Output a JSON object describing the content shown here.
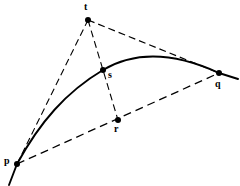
{
  "diagram": {
    "background_color": "#ffffff",
    "stroke_color": "#000000",
    "points": [
      {
        "id": "p",
        "label": "p",
        "x": 17,
        "y": 164,
        "label_x": 4,
        "label_y": 156,
        "dot_radius": 3.0
      },
      {
        "id": "q",
        "label": "q",
        "x": 219,
        "y": 73,
        "label_x": 215,
        "label_y": 79,
        "dot_radius": 3.0
      },
      {
        "id": "r",
        "label": "r",
        "x": 118,
        "y": 120,
        "label_x": 114,
        "label_y": 124,
        "dot_radius": 3.0
      },
      {
        "id": "s",
        "label": "s",
        "x": 103,
        "y": 70,
        "label_x": 108,
        "label_y": 70,
        "dot_radius": 3.0
      },
      {
        "id": "t",
        "label": "t",
        "x": 88,
        "y": 20,
        "label_x": 84,
        "label_y": 2,
        "dot_radius": 3.0
      }
    ],
    "solid_curve": {
      "name": "parabolic-arc",
      "description": "solid arc running from lower-left through s to q and beyond",
      "path": "M 9,185 L 17,164 C 40,122 66,92 103,70 C 140,48 182,56 219,73 L 238,79",
      "stroke_width": 1.9,
      "dash": "none"
    },
    "dashed_lines": [
      {
        "name": "tangent-p-t",
        "from": "p",
        "to": "t",
        "x1": 17,
        "y1": 164,
        "x2": 88,
        "y2": 20,
        "dash": "7 4",
        "stroke_width": 1.1
      },
      {
        "name": "tangent-t-q",
        "from": "t",
        "to": "q",
        "x1": 88,
        "y1": 20,
        "x2": 219,
        "y2": 73,
        "dash": "7 4",
        "stroke_width": 1.1
      },
      {
        "name": "median-t-r",
        "from": "t",
        "to": "r",
        "x1": 88,
        "y1": 20,
        "x2": 118,
        "y2": 120,
        "dash": "7 4",
        "stroke_width": 1.1
      },
      {
        "name": "chord-p-q",
        "from": "p",
        "to": "q",
        "x1": 17,
        "y1": 164,
        "x2": 219,
        "y2": 73,
        "dash": "8 5",
        "stroke_width": 1.3
      }
    ]
  }
}
